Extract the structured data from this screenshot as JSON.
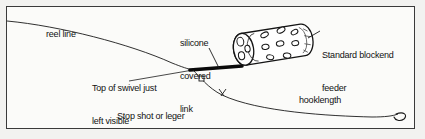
{
  "diagram": {
    "background_color": "#f2f2f0",
    "panel_color": "#fbfbf9",
    "ink_color": "#111111",
    "border_color": "#3a3a3a",
    "labels": {
      "reel_line": "reel line",
      "silicone_covered_link": "silicone\ncovered\nlink",
      "silicone_line1": "silicone",
      "silicone_line2": "covered",
      "silicone_line3": "link",
      "top_of_swivel": "Top of swivel just\nleft visible",
      "top_of_swivel_line1": "Top of swivel just",
      "top_of_swivel_line2": "left visible",
      "stop_shot": "Stop shot or leger\nstop",
      "stop_shot_line1": "Stop shot or leger",
      "stop_shot_line2": "stop",
      "standard_feeder": "Standard blockend\nfeeder",
      "standard_feeder_line1": "Standard blockend",
      "standard_feeder_line2": "feeder",
      "hooklength": "hooklength"
    },
    "parts": [
      {
        "name": "reel-line",
        "kind": "curve"
      },
      {
        "name": "silicone-covered-link",
        "kind": "thick-line"
      },
      {
        "name": "blockend-feeder",
        "kind": "cylinder-with-holes"
      },
      {
        "name": "swivel",
        "kind": "small-square"
      },
      {
        "name": "stop-shot",
        "kind": "knot-marker"
      },
      {
        "name": "hooklength",
        "kind": "curve"
      },
      {
        "name": "hook",
        "kind": "hook-curve"
      }
    ]
  }
}
